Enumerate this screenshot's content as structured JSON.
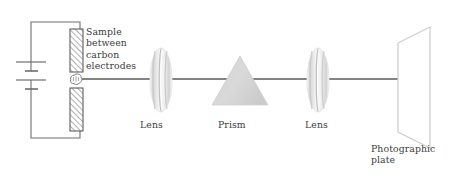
{
  "figure": {
    "background_color": "#ffffff",
    "line_color": "#4a4a4a",
    "text_color": "#3b3b3b",
    "element_fill": "#d9d9d9"
  },
  "labels": {
    "sample": "Sample\nbetween\ncarbon\nelectrodes",
    "lens_1": "Lens",
    "prism": "Prism",
    "lens_2": "Lens",
    "plate": "Photographic\nplate"
  },
  "components": {
    "battery": {
      "name": "battery",
      "plates": [
        {
          "type": "long",
          "y": 62
        },
        {
          "type": "short",
          "y": 71
        },
        {
          "type": "long",
          "y": 80
        },
        {
          "type": "short",
          "y": 89
        }
      ]
    },
    "circuit": {
      "name": "circuit-wire",
      "left_x": 31,
      "right_x": 80,
      "top_y": 22,
      "bottom_y": 138
    },
    "electrode_top": {
      "x": 70,
      "y": 29,
      "width": 13,
      "height": 43,
      "hatch": "diagonal"
    },
    "electrode_bottom": {
      "x": 70,
      "y": 88,
      "width": 13,
      "height": 43,
      "hatch": "diagonal"
    },
    "spark": {
      "cx": 76,
      "cy": 79,
      "r": 5
    },
    "lens_1": {
      "cx": 161,
      "cy": 80,
      "rx": 11,
      "ry": 32
    },
    "prism": {
      "apex_x": 240,
      "apex_y": 56,
      "base_y": 105,
      "half_width": 28
    },
    "lens_2": {
      "cx": 318,
      "cy": 80,
      "rx": 11,
      "ry": 32
    },
    "plate": {
      "points": "398,43 430,27 430,148 398,132",
      "name": "photographic-plate"
    },
    "beam": {
      "x1": 82,
      "y1": 79,
      "x2": 415,
      "y2": 79
    }
  }
}
